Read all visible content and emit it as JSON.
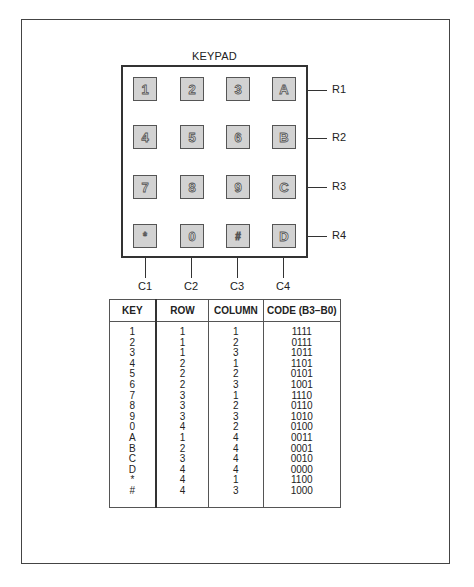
{
  "keypad": {
    "title": "KEYPAD",
    "rows": [
      [
        "1",
        "2",
        "3",
        "A"
      ],
      [
        "4",
        "5",
        "6",
        "B"
      ],
      [
        "7",
        "8",
        "9",
        "C"
      ],
      [
        "*",
        "0",
        "#",
        "D"
      ]
    ],
    "row_labels": [
      "R1",
      "R2",
      "R3",
      "R4"
    ],
    "column_labels": [
      "C1",
      "C2",
      "C3",
      "C4"
    ]
  },
  "table": {
    "headers": [
      "KEY",
      "ROW",
      "COLUMN",
      "CODE (B3–B0)"
    ],
    "rows": [
      [
        "1",
        "1",
        "1",
        "1111"
      ],
      [
        "2",
        "1",
        "2",
        "0111"
      ],
      [
        "3",
        "1",
        "3",
        "1011"
      ],
      [
        "4",
        "2",
        "1",
        "1101"
      ],
      [
        "5",
        "2",
        "2",
        "0101"
      ],
      [
        "6",
        "2",
        "3",
        "1001"
      ],
      [
        "7",
        "3",
        "1",
        "1110"
      ],
      [
        "8",
        "3",
        "2",
        "0110"
      ],
      [
        "9",
        "3",
        "3",
        "1010"
      ],
      [
        "0",
        "4",
        "2",
        "0100"
      ],
      [
        "A",
        "1",
        "4",
        "0011"
      ],
      [
        "B",
        "2",
        "4",
        "0001"
      ],
      [
        "C",
        "3",
        "4",
        "0010"
      ],
      [
        "D",
        "4",
        "4",
        "0000"
      ],
      [
        "*",
        "4",
        "1",
        "1100"
      ],
      [
        "#",
        "4",
        "3",
        "1000"
      ]
    ]
  }
}
